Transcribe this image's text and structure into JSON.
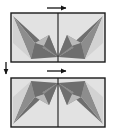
{
  "figure": {
    "title": "",
    "background_color": "#ffffff",
    "width": 114,
    "height": 133
  },
  "palette": {
    "panel_background": "#e2e2e2",
    "panel_border": "#1a1a1a",
    "divider": "#1a1a1a",
    "dark_gray": "#6e6e6e",
    "mid_gray": "#8d8d8d",
    "light_gray": "#b9b9b9",
    "pale_gray": "#d2d2d2",
    "arrow_color": "#141414"
  },
  "panels": [
    {
      "id": "panel-top",
      "label": "",
      "x": 11,
      "y": 13,
      "width": 94,
      "height": 49,
      "divider_x": 58,
      "orientation": "apex-down",
      "halves": [
        {
          "id": "top-left-half",
          "mirror": false
        },
        {
          "id": "top-right-half",
          "mirror": true
        }
      ]
    },
    {
      "id": "panel-bottom",
      "label": "",
      "x": 11,
      "y": 78,
      "width": 94,
      "height": 49,
      "divider_x": 58,
      "orientation": "apex-up",
      "halves": [
        {
          "id": "bottom-left-half",
          "mirror": false
        },
        {
          "id": "bottom-right-half",
          "mirror": true
        }
      ]
    }
  ],
  "arrows": [
    {
      "id": "arrow-top-horizontal",
      "direction": "right",
      "x1": 47,
      "y1": 8,
      "x2": 68,
      "y2": 8,
      "label": ""
    },
    {
      "id": "arrow-left-vertical",
      "direction": "down",
      "x1": 6,
      "y1": 62,
      "x2": 6,
      "y2": 76,
      "label": ""
    },
    {
      "id": "arrow-bottom-horizontal",
      "direction": "right",
      "x1": 47,
      "y1": 71,
      "x2": 68,
      "y2": 71,
      "label": ""
    }
  ]
}
